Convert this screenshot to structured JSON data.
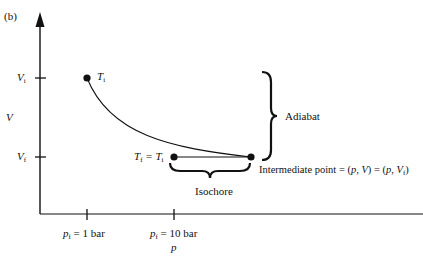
{
  "figure": {
    "panel_label": "(b)",
    "y_axis": {
      "label": "V",
      "ticks": [
        {
          "main": "V",
          "sub": "i"
        },
        {
          "main": "V",
          "sub": "f"
        }
      ]
    },
    "x_axis": {
      "label": "p",
      "ticks": [
        {
          "main": "p",
          "sub": "f",
          "rest": " = 1 bar"
        },
        {
          "main": "p",
          "sub": "f",
          "rest": " = 10 bar"
        }
      ]
    },
    "points": {
      "initial": {
        "main": "T",
        "sub": "i"
      },
      "final": {
        "main": "T",
        "sub": "f",
        "eq": " = T",
        "eq_sub": "i"
      }
    },
    "annotations": {
      "adiabat": "Adiabat",
      "isochore": "Isochore",
      "intermediate_prefix": "Intermediate point = (",
      "intermediate_p1": "p",
      "intermediate_mid1": ", ",
      "intermediate_v1": "V",
      "intermediate_mid2": ") = (",
      "intermediate_p2": "p",
      "intermediate_mid3": ", ",
      "intermediate_v2": "V",
      "intermediate_v2_sub": "f",
      "intermediate_suffix": ")"
    },
    "colors": {
      "ink": "#111111",
      "background": "#ffffff"
    }
  }
}
